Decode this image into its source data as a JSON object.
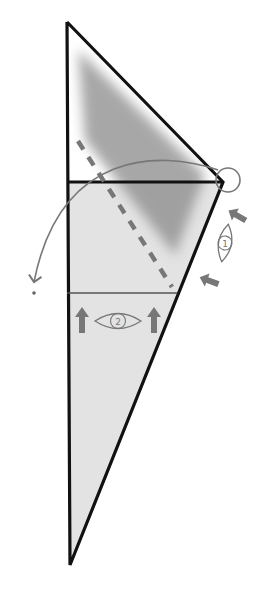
{
  "diagram": {
    "type": "origami-fold-step",
    "colors": {
      "paper_fill": "#e3e3e3",
      "shade": "#8a8a8a",
      "outline": "#111111",
      "annotation": "#777777"
    },
    "view_markers": [
      {
        "number": "1"
      },
      {
        "number": "2"
      }
    ]
  }
}
